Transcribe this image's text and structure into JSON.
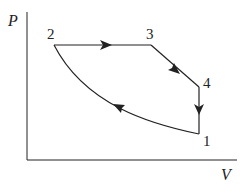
{
  "diagram": {
    "type": "PV-cycle",
    "axes": {
      "x_label": "V",
      "y_label": "P"
    },
    "points": [
      {
        "id": "1",
        "label": "1",
        "x": 199,
        "y": 134
      },
      {
        "id": "2",
        "label": "2",
        "x": 54,
        "y": 45
      },
      {
        "id": "3",
        "label": "3",
        "x": 151,
        "y": 45
      },
      {
        "id": "4",
        "label": "4",
        "x": 199,
        "y": 87
      }
    ],
    "processes": [
      {
        "from": "2",
        "to": "3",
        "shape": "horizontal line",
        "arrow": "right"
      },
      {
        "from": "3",
        "to": "4",
        "shape": "diagonal line",
        "arrow": "down-right"
      },
      {
        "from": "4",
        "to": "1",
        "shape": "vertical line",
        "arrow": "down"
      },
      {
        "from": "1",
        "to": "2",
        "shape": "curve",
        "arrow": "up-left"
      }
    ],
    "colors": {
      "stroke": "#222222",
      "background": "#ffffff"
    }
  }
}
